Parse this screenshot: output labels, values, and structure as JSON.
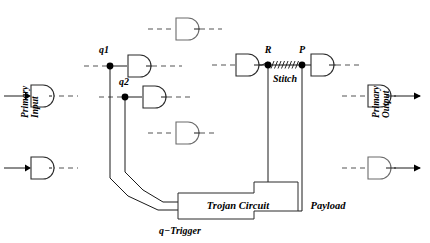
{
  "figure": {
    "type": "logic-circuit-diagram",
    "background_color": "#ffffff",
    "line_color": "#1a1a1a",
    "dashed_color": "#555555"
  },
  "labels": {
    "q1": "q1",
    "q2": "q2",
    "R": "R",
    "P": "P",
    "stitch": "Stitch",
    "trojan_circuit": "Trojan Circuit",
    "payload": "Payload",
    "q_trigger": "q−Trigger",
    "primary_input": "Primary\nInput",
    "primary_input_line1": "Primary",
    "primary_input_line2": "Input",
    "primary_output_line1": "Primary",
    "primary_output_line2": "Output"
  },
  "gates": [
    {
      "id": "gate-pi-top",
      "name": "and-gate-primary-input-top",
      "x": 26,
      "y": 88,
      "style": "solid"
    },
    {
      "id": "gate-pi-bottom",
      "name": "and-gate-primary-input-bottom",
      "x": 26,
      "y": 160,
      "style": "solid"
    },
    {
      "id": "gate-q1",
      "name": "and-gate-q1",
      "x": 128,
      "y": 61,
      "style": "solid"
    },
    {
      "id": "gate-q2",
      "name": "and-gate-q2",
      "x": 143,
      "y": 92,
      "style": "solid"
    },
    {
      "id": "gate-top-right",
      "name": "and-gate-upper-mid",
      "x": 176,
      "y": 21,
      "style": "light"
    },
    {
      "id": "gate-mid",
      "name": "and-gate-middle",
      "x": 176,
      "y": 125,
      "style": "light"
    },
    {
      "id": "gate-r",
      "name": "and-gate-r-driver",
      "x": 238,
      "y": 57,
      "style": "solid"
    },
    {
      "id": "gate-p",
      "name": "and-gate-p-load",
      "x": 312,
      "y": 57,
      "style": "solid"
    },
    {
      "id": "gate-po-top",
      "name": "and-gate-primary-output-top",
      "x": 370,
      "y": 88,
      "style": "solid"
    },
    {
      "id": "gate-po-bottom",
      "name": "and-gate-primary-output-bottom",
      "x": 370,
      "y": 160,
      "style": "light"
    }
  ],
  "nodes": [
    {
      "name": "node-q1",
      "label": "q1",
      "x": 110,
      "y": 66
    },
    {
      "name": "node-q2",
      "label": "q2",
      "x": 125,
      "y": 97
    },
    {
      "name": "node-R",
      "label": "R",
      "x": 268,
      "y": 62
    },
    {
      "name": "node-P",
      "label": "P",
      "x": 302,
      "y": 62
    }
  ],
  "blocks": [
    {
      "name": "trojan-circuit-block",
      "label": "Trojan Circuit",
      "x": 178,
      "y": 193,
      "width": 120,
      "height": 26
    }
  ]
}
